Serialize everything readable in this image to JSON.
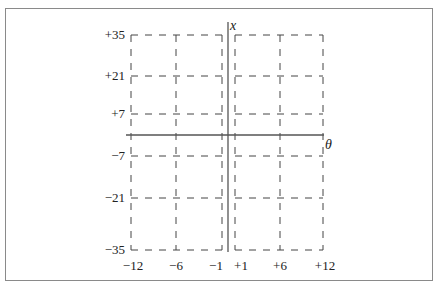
{
  "chart_data": {
    "type": "diagram",
    "title": "",
    "xlabel": "θ",
    "ylabel": "x",
    "x_ticks": [
      "-12",
      "-6",
      "-1",
      "+1",
      "+6",
      "+12"
    ],
    "x_values": [
      -12,
      -6,
      -1,
      1,
      6,
      12
    ],
    "y_ticks": [
      "+35",
      "+21",
      "+7",
      "-7",
      "-21",
      "-35"
    ],
    "y_values": [
      35,
      21,
      7,
      -7,
      -21,
      -35
    ],
    "grid": "dashed"
  },
  "labels": {
    "x_axis": "θ",
    "y_axis": "x",
    "x_ticks": [
      "−12",
      "−6",
      "−1",
      "+1",
      "+6",
      "+12"
    ],
    "y_ticks": [
      "+35",
      "+21",
      "+7",
      "−7",
      "−21",
      "−35"
    ]
  },
  "colors": {
    "grid": "#444444",
    "axis": "#555555",
    "frame": "#8a8a8a"
  }
}
